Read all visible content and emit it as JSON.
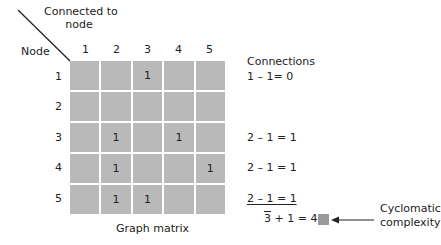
{
  "header": {
    "connected_to_line1": "Connected to",
    "connected_to_line2": "node",
    "node_label": "Node"
  },
  "columns": [
    "1",
    "2",
    "3",
    "4",
    "5"
  ],
  "rows": [
    {
      "label": "1",
      "cells": [
        "",
        "",
        "1",
        "",
        ""
      ],
      "connections": "1 – 1= 0"
    },
    {
      "label": "2",
      "cells": [
        "",
        "",
        "",
        "",
        ""
      ],
      "connections": ""
    },
    {
      "label": "3",
      "cells": [
        "",
        "1",
        "",
        "1",
        ""
      ],
      "connections": "2 – 1 = 1"
    },
    {
      "label": "4",
      "cells": [
        "",
        "1",
        "",
        "",
        "1"
      ],
      "connections": "2 – 1 = 1"
    },
    {
      "label": "5",
      "cells": [
        "",
        "1",
        "1",
        "",
        ""
      ],
      "connections": "2 – 1 = 1"
    }
  ],
  "connections_header": "Connections",
  "sum": {
    "total": "3",
    "rest": " + 1 = 4"
  },
  "caption": "Graph matrix",
  "annotation": {
    "line1": "Cyclomatic",
    "line2": "complexity"
  },
  "colors": {
    "cell_fill": "#b9b9b9",
    "marker_fill": "#9a9a9a"
  }
}
